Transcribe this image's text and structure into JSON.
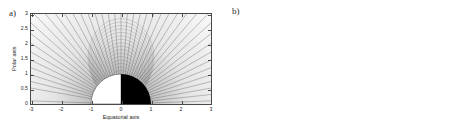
{
  "figure": {
    "caption_a": "a)",
    "caption_b": "b)",
    "background": "#ffffff",
    "frame_color": "#4a4a4a",
    "line_color": "#5a5a5a",
    "shading_dark": "#1c1c1c",
    "shading_light": "#f2f2f2"
  },
  "chart_data": [
    {
      "type": "line",
      "panel": "a",
      "title": "a)",
      "xlabel": "Equatorial axis",
      "ylabel": "Polar axis",
      "xlim": [
        -3,
        3
      ],
      "ylim": [
        0,
        3
      ],
      "xticks": [
        -3,
        -2,
        -1,
        0,
        1,
        2,
        3
      ],
      "xticklabels": [
        "-3",
        "-2",
        "-1",
        "0",
        "1",
        "2",
        "3"
      ],
      "yticks": [
        0,
        0.5,
        1,
        1.5,
        2,
        2.5,
        3
      ],
      "yticklabels": [
        "0",
        "0.5",
        "1",
        "1.5",
        "2",
        "2.5",
        "3"
      ],
      "grid": false,
      "legend": "none",
      "description": "Radial magnetic field lines of a uniformly magnetized sphere, emanating from the origin over a grayscale density background. A half-disk of radius 1 sits at the origin: left half rendered white, right half rendered black.",
      "body_radius": 1,
      "body_left_fill": "#ffffff",
      "body_right_fill": "#000000",
      "field_line_count": 44,
      "field_line_angles_deg": [
        2,
        6,
        10,
        14,
        18,
        22,
        26,
        30,
        34,
        38,
        42,
        46,
        50,
        54,
        58,
        62,
        66,
        70,
        74,
        78,
        82,
        86,
        90,
        94,
        98,
        102,
        106,
        110,
        114,
        118,
        122,
        126,
        130,
        134,
        138,
        142,
        146,
        150,
        154,
        158,
        162,
        166,
        170,
        178
      ],
      "shading": {
        "kind": "radial-grayscale",
        "center": [
          0,
          0
        ],
        "inner_value": 0.45,
        "outer_value": 0.97
      }
    },
    {
      "type": "line",
      "panel": "b",
      "title": "b)",
      "xlabel": "Equatorial axis",
      "ylabel": "Polar axis",
      "xlim": [
        -25,
        25
      ],
      "ylim": [
        0,
        25
      ],
      "xticks": [
        -25,
        -20,
        -15,
        -10,
        -5,
        0,
        5,
        10,
        15,
        20,
        25
      ],
      "xticklabels": [
        "-25",
        "-20",
        "-15",
        "-10",
        "-5",
        "0",
        "5",
        "10",
        "15",
        "20",
        "25"
      ],
      "yticks": [
        0,
        5,
        10,
        15,
        20,
        25
      ],
      "yticklabels": [
        "0",
        "5",
        "10",
        "15",
        "20",
        "25"
      ],
      "grid": false,
      "legend": "none",
      "description": "Large-scale view of the same field. Field lines converge into a dark cusp at the origin, with a small white point source at the centre. Two nested dark circular arcs mark boundary surfaces at radii of about 16 and 17.",
      "arc_radii": [
        16,
        17
      ],
      "arc_color": "#3a3a3a",
      "point_source_fill": "#ffffff",
      "field_line_count": 46,
      "field_line_angles_deg": [
        3,
        7,
        11,
        15,
        19,
        23,
        27,
        31,
        35,
        39,
        43,
        47,
        51,
        55,
        59,
        63,
        67,
        71,
        75,
        79,
        83,
        87,
        90,
        93,
        97,
        101,
        105,
        109,
        113,
        117,
        121,
        125,
        129,
        133,
        137,
        141,
        145,
        149,
        153,
        157,
        161,
        165,
        169,
        173,
        177,
        179
      ],
      "shading": {
        "kind": "radial-grayscale",
        "center": [
          0,
          0
        ],
        "inner_value": 0.12,
        "outer_value": 0.96
      }
    }
  ]
}
